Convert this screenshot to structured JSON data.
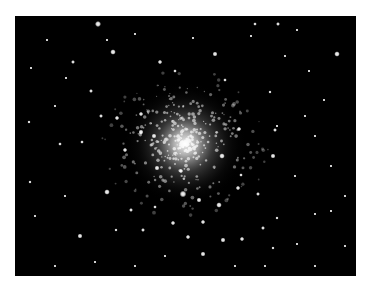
{
  "image": {
    "subject": "globular star cluster",
    "background": "#000000",
    "border": "#ffffff",
    "core": {
      "cx": 170,
      "cy": 128
    }
  },
  "stars": [
    [
      83,
      8,
      2.2
    ],
    [
      240,
      8,
      1.3
    ],
    [
      263,
      8,
      1.4
    ],
    [
      322,
      38,
      2.0
    ],
    [
      98,
      36,
      2.0
    ],
    [
      200,
      38,
      1.8
    ],
    [
      145,
      46,
      1.6
    ],
    [
      58,
      46,
      1.4
    ],
    [
      14,
      106,
      1.2
    ],
    [
      76,
      75,
      1.4
    ],
    [
      51,
      62,
      1.0
    ],
    [
      160,
      55,
      1.3
    ],
    [
      210,
      64,
      1.3
    ],
    [
      294,
      55,
      1.0
    ],
    [
      309,
      84,
      1.0
    ],
    [
      255,
      76,
      1.2
    ],
    [
      102,
      102,
      1.6
    ],
    [
      86,
      100,
      1.4
    ],
    [
      126,
      98,
      1.6
    ],
    [
      126,
      116,
      1.8
    ],
    [
      224,
      113,
      1.6
    ],
    [
      260,
      114,
      1.4
    ],
    [
      258,
      140,
      1.8
    ],
    [
      262,
      110,
      1.0
    ],
    [
      45,
      128,
      1.3
    ],
    [
      67,
      126,
      1.3
    ],
    [
      110,
      134,
      1.6
    ],
    [
      139,
      120,
      1.8
    ],
    [
      142,
      152,
      1.8
    ],
    [
      166,
      155,
      1.6
    ],
    [
      207,
      140,
      2.0
    ],
    [
      226,
      159,
      1.3
    ],
    [
      92,
      176,
      2.0
    ],
    [
      65,
      220,
      1.8
    ],
    [
      15,
      166,
      1.2
    ],
    [
      168,
      178,
      2.4
    ],
    [
      184,
      184,
      1.8
    ],
    [
      204,
      189,
      2.0
    ],
    [
      223,
      172,
      1.6
    ],
    [
      243,
      178,
      1.4
    ],
    [
      158,
      207,
      1.6
    ],
    [
      173,
      221,
      1.6
    ],
    [
      188,
      206,
      1.6
    ],
    [
      208,
      224,
      1.8
    ],
    [
      227,
      223,
      1.6
    ],
    [
      248,
      212,
      1.4
    ],
    [
      262,
      202,
      1.2
    ],
    [
      188,
      238,
      1.8
    ],
    [
      128,
      214,
      1.4
    ],
    [
      101,
      214,
      1.2
    ],
    [
      116,
      194,
      1.4
    ],
    [
      140,
      191,
      1.3
    ],
    [
      258,
      232,
      1.2
    ],
    [
      316,
      195,
      1.0
    ],
    [
      300,
      198,
      1.0
    ],
    [
      282,
      228,
      1.0
    ],
    [
      236,
      20,
      1.0
    ],
    [
      92,
      24,
      1.0
    ],
    [
      32,
      24,
      1.0
    ],
    [
      120,
      18,
      1.0
    ],
    [
      178,
      22,
      1.0
    ],
    [
      282,
      14,
      1.0
    ],
    [
      16,
      52,
      1.0
    ],
    [
      40,
      90,
      1.0
    ],
    [
      300,
      120,
      1.0
    ],
    [
      316,
      150,
      1.0
    ],
    [
      330,
      180,
      1.0
    ],
    [
      330,
      230,
      1.0
    ],
    [
      300,
      250,
      1.0
    ],
    [
      40,
      250,
      1.0
    ],
    [
      80,
      246,
      1.0
    ],
    [
      120,
      250,
      1.0
    ],
    [
      150,
      240,
      1.0
    ],
    [
      220,
      250,
      1.0
    ],
    [
      250,
      250,
      1.0
    ],
    [
      20,
      200,
      1.0
    ],
    [
      50,
      180,
      1.0
    ],
    [
      280,
      160,
      1.0
    ],
    [
      290,
      100,
      1.0
    ],
    [
      270,
      40,
      1.0
    ]
  ]
}
